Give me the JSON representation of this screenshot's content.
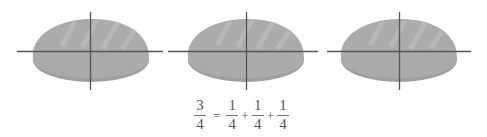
{
  "figure": {
    "loaves": [
      {
        "id": 1,
        "parts": 4,
        "label": "loaf-1"
      },
      {
        "id": 2,
        "parts": 4,
        "label": "loaf-2"
      },
      {
        "id": 3,
        "parts": 4,
        "label": "loaf-3"
      }
    ],
    "colors": {
      "bread": "#a9a9a9",
      "bread_bottom": "#9d9d9d",
      "highlight": "#bdbdbd",
      "divider_line": "#555555",
      "text": "#555555"
    }
  },
  "equation": {
    "lhs": {
      "numerator": "3",
      "denominator": "4"
    },
    "equals": "=",
    "plus": "+",
    "terms": [
      {
        "numerator": "1",
        "denominator": "4"
      },
      {
        "numerator": "1",
        "denominator": "4"
      },
      {
        "numerator": "1",
        "denominator": "4"
      }
    ]
  }
}
